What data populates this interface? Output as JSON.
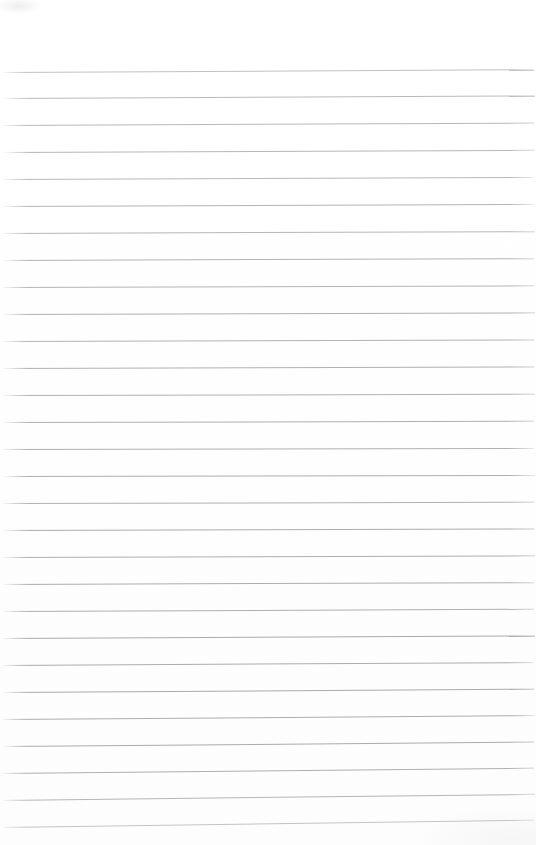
{
  "page": {
    "kind": "ruled-notepad-scan",
    "width": 536,
    "height": 845,
    "background_color": "#ffffff",
    "has_text_content": false,
    "has_margin_rule": false,
    "has_header": false,
    "has_page_number": false,
    "top_margin_px": 72,
    "first_line_y": 72,
    "line_spacing_px": 26.8,
    "line_count": 29,
    "line_color": "#9b9ba1",
    "line_thickness_px": 1,
    "scan_skew_deg": -0.32,
    "top_margin_label": "",
    "body_text": ""
  },
  "rules": {
    "lines": [
      {
        "y": 72,
        "skew": -0.3,
        "opacity": 0.62,
        "left": 2,
        "right": 2
      },
      {
        "y": 98,
        "skew": -0.28,
        "opacity": 0.68,
        "left": 3,
        "right": 1
      },
      {
        "y": 125,
        "skew": -0.26,
        "opacity": 0.7,
        "left": 2,
        "right": 2
      },
      {
        "y": 152,
        "skew": -0.24,
        "opacity": 0.72,
        "left": 4,
        "right": 1
      },
      {
        "y": 179,
        "skew": -0.22,
        "opacity": 0.7,
        "left": 2,
        "right": 2
      },
      {
        "y": 206,
        "skew": -0.22,
        "opacity": 0.74,
        "left": 3,
        "right": 2
      },
      {
        "y": 233,
        "skew": -0.2,
        "opacity": 0.72,
        "left": 2,
        "right": 1
      },
      {
        "y": 260,
        "skew": -0.2,
        "opacity": 0.76,
        "left": 3,
        "right": 2
      },
      {
        "y": 287,
        "skew": -0.18,
        "opacity": 0.74,
        "left": 2,
        "right": 2
      },
      {
        "y": 314,
        "skew": -0.18,
        "opacity": 0.78,
        "left": 3,
        "right": 1
      },
      {
        "y": 341,
        "skew": -0.16,
        "opacity": 0.76,
        "left": 2,
        "right": 2
      },
      {
        "y": 368,
        "skew": -0.16,
        "opacity": 0.78,
        "left": 3,
        "right": 2
      },
      {
        "y": 395,
        "skew": -0.14,
        "opacity": 0.76,
        "left": 2,
        "right": 1
      },
      {
        "y": 422,
        "skew": -0.14,
        "opacity": 0.8,
        "left": 3,
        "right": 2
      },
      {
        "y": 449,
        "skew": -0.12,
        "opacity": 0.78,
        "left": 2,
        "right": 2
      },
      {
        "y": 476,
        "skew": -0.12,
        "opacity": 0.8,
        "left": 3,
        "right": 1
      },
      {
        "y": 503,
        "skew": -0.14,
        "opacity": 0.78,
        "left": 2,
        "right": 2
      },
      {
        "y": 530,
        "skew": -0.16,
        "opacity": 0.82,
        "left": 3,
        "right": 2
      },
      {
        "y": 557,
        "skew": -0.18,
        "opacity": 0.8,
        "left": 2,
        "right": 1
      },
      {
        "y": 584,
        "skew": -0.2,
        "opacity": 0.82,
        "left": 3,
        "right": 2
      },
      {
        "y": 611,
        "skew": -0.24,
        "opacity": 0.8,
        "left": 2,
        "right": 2
      },
      {
        "y": 638,
        "skew": -0.28,
        "opacity": 0.84,
        "left": 3,
        "right": 1
      },
      {
        "y": 665,
        "skew": -0.32,
        "opacity": 0.82,
        "left": 2,
        "right": 2
      },
      {
        "y": 692,
        "skew": -0.36,
        "opacity": 0.84,
        "left": 3,
        "right": 2
      },
      {
        "y": 719,
        "skew": -0.42,
        "opacity": 0.82,
        "left": 2,
        "right": 1
      },
      {
        "y": 746,
        "skew": -0.48,
        "opacity": 0.84,
        "left": 3,
        "right": 2
      },
      {
        "y": 773,
        "skew": -0.56,
        "opacity": 0.8,
        "left": 2,
        "right": 2
      },
      {
        "y": 800,
        "skew": -0.66,
        "opacity": 0.72,
        "left": 3,
        "right": 1
      },
      {
        "y": 827,
        "skew": -0.78,
        "opacity": 0.58,
        "left": 2,
        "right": 2
      }
    ]
  },
  "writing_rows": {
    "count": 29,
    "values": [
      "",
      "",
      "",
      "",
      "",
      "",
      "",
      "",
      "",
      "",
      "",
      "",
      "",
      "",
      "",
      "",
      "",
      "",
      "",
      "",
      "",
      "",
      "",
      "",
      "",
      "",
      "",
      "",
      ""
    ]
  }
}
